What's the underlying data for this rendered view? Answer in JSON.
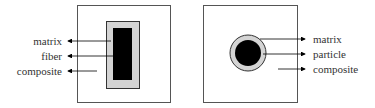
{
  "diagram": {
    "colors": {
      "outline": "#555555",
      "interphase": "#d4d4d4",
      "core": "#000000",
      "text": "#333333"
    },
    "fiber_composite": {
      "labels": [
        "matrix",
        "fiber",
        "composite"
      ]
    },
    "particle_composite": {
      "labels": [
        "matrix",
        "particle",
        "composite"
      ]
    }
  }
}
